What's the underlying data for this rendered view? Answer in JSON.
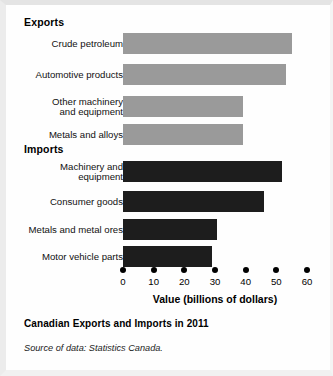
{
  "figure": {
    "caption": "Canadian Exports and Imports in 2011",
    "source": "Source of data: Statistics Canada."
  },
  "sections": {
    "exports_label": "Exports",
    "imports_label": "Imports"
  },
  "chart_data": {
    "type": "bar",
    "orientation": "horizontal",
    "title": "Canadian Exports and Imports in 2011",
    "xlabel": "Value (billions of dollars)",
    "ylabel": "",
    "xlim": [
      0,
      60
    ],
    "xticks": [
      0,
      10,
      20,
      30,
      40,
      50,
      60
    ],
    "xtick_labels": [
      "0",
      "10",
      "20",
      "30",
      "40",
      "50",
      "60"
    ],
    "grid": false,
    "legend": "none",
    "groups": [
      {
        "name": "Exports",
        "color": "#9a9a9a",
        "categories": [
          "Crude petroleum",
          "Automotive products",
          "Other machinery\nand equipment",
          "Metals and alloys"
        ],
        "values": [
          55,
          53,
          39,
          39
        ]
      },
      {
        "name": "Imports",
        "color": "#1d1d1d",
        "categories": [
          "Machinery and\nequipment",
          "Consumer goods",
          "Metals and metal ores",
          "Motor vehicle parts"
        ],
        "values": [
          52,
          46,
          30.5,
          29
        ]
      }
    ]
  },
  "axis": {
    "title": "Value (billions of dollars)",
    "ticks": [
      {
        "value": 0,
        "label": "0"
      },
      {
        "value": 10,
        "label": "10"
      },
      {
        "value": 20,
        "label": "20"
      },
      {
        "value": 30,
        "label": "30"
      },
      {
        "value": 40,
        "label": "40"
      },
      {
        "value": 50,
        "label": "50"
      },
      {
        "value": 60,
        "label": "60"
      }
    ]
  },
  "bars": [
    {
      "label": "Crude petroleum",
      "value": 55,
      "group": "export",
      "top": 28
    },
    {
      "label": "Automotive products",
      "value": 53,
      "group": "export",
      "top": 59
    },
    {
      "label": "Other machinery\nand equipment",
      "value": 39,
      "group": "export",
      "top": 91
    },
    {
      "label": "Metals and alloys",
      "value": 39,
      "group": "export",
      "top": 119
    },
    {
      "label": "Machinery and\nequipment",
      "value": 52,
      "group": "import",
      "top": 156
    },
    {
      "label": "Consumer goods",
      "value": 46,
      "group": "import",
      "top": 186
    },
    {
      "label": "Metals and metal ores",
      "value": 30.5,
      "group": "import",
      "top": 214
    },
    {
      "label": "Motor vehicle parts",
      "value": 29,
      "group": "import",
      "top": 241
    }
  ]
}
